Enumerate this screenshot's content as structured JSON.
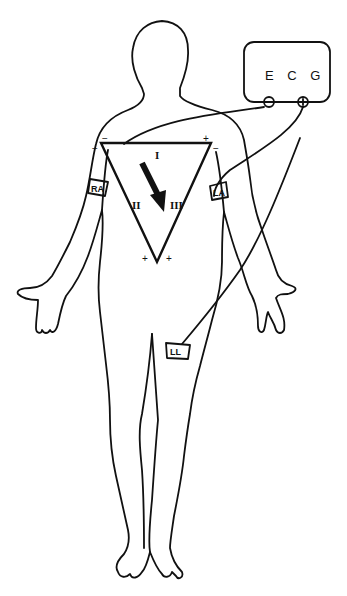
{
  "diagram": {
    "type": "Einthoven's triangle ECG lead placement",
    "ecg_box": {
      "label": "E C G",
      "terminals": {
        "negative": "−",
        "positive": "+"
      }
    },
    "electrodes": {
      "ra": "RA",
      "la": "LA",
      "ll": "LL"
    },
    "triangle": {
      "leads": {
        "lead1": "I",
        "lead2": "II",
        "lead3": "III"
      },
      "signs": {
        "top_left_a": "−",
        "top_left_b": "−",
        "top_right_a": "+",
        "top_right_b": "−",
        "bottom_left": "+",
        "bottom_right": "+"
      }
    },
    "colors": {
      "line": "#111111",
      "background": "#ffffff"
    }
  }
}
